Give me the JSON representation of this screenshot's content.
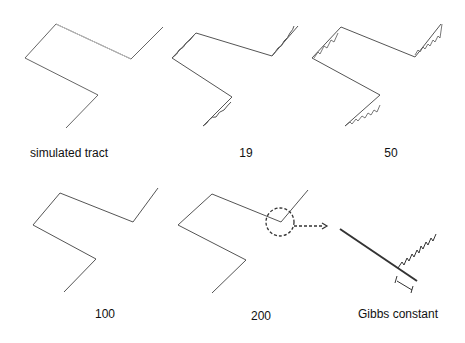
{
  "panels": [
    {
      "id": "simulated",
      "label": "simulated tract"
    },
    {
      "id": "n19",
      "label": "19"
    },
    {
      "id": "n50",
      "label": "50"
    },
    {
      "id": "n100",
      "label": "100"
    },
    {
      "id": "n200",
      "label": "200"
    },
    {
      "id": "gibbs",
      "label": "Gibbs constant"
    }
  ],
  "colors": {
    "line": "#555555",
    "text": "#111111"
  }
}
